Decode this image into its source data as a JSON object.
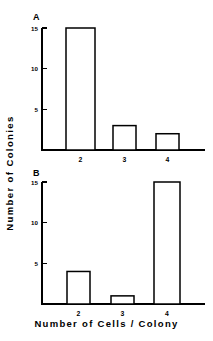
{
  "figure": {
    "y_axis_title": "Number of Colonies",
    "x_axis_title": "Number of Cells / Colony"
  },
  "panels": [
    {
      "letter": "A",
      "y_ticks": [
        "5",
        "10",
        "15"
      ],
      "x_ticks": [
        "2",
        "3",
        "4"
      ]
    },
    {
      "letter": "B",
      "y_ticks": [
        "5",
        "10",
        "15"
      ],
      "x_ticks": [
        "2",
        "3",
        "4"
      ]
    }
  ],
  "chart_data": [
    {
      "type": "bar",
      "title": "A",
      "categories": [
        "2",
        "3",
        "4"
      ],
      "values": [
        15,
        3,
        2
      ],
      "xlabel": "Number of Cells / Colony",
      "ylabel": "Number of Colonies",
      "ylim": [
        0,
        16
      ],
      "yticks": [
        5,
        10,
        15
      ],
      "grid": false,
      "legend": "none"
    },
    {
      "type": "bar",
      "title": "B",
      "categories": [
        "2",
        "3",
        "4"
      ],
      "values": [
        4,
        1,
        15
      ],
      "xlabel": "Number of Cells / Colony",
      "ylabel": "Number of Colonies",
      "ylim": [
        0,
        16
      ],
      "yticks": [
        5,
        10,
        15
      ],
      "grid": false,
      "legend": "none"
    }
  ]
}
